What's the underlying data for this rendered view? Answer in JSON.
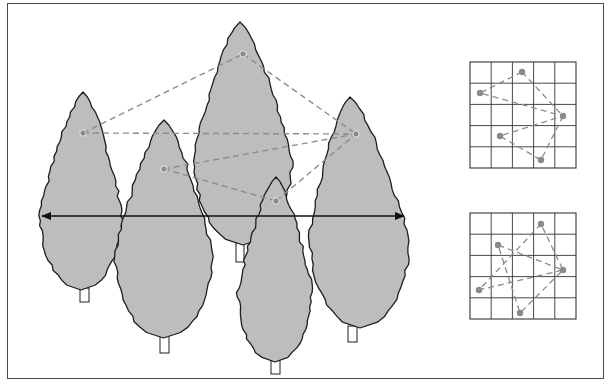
{
  "figure": {
    "description": "Five cypress-like trees with sampled points connected by dashed lines, a double-headed horizontal measurement arrow, and two 5x5 grid insets showing point configurations",
    "colors": {
      "background": "#ffffff",
      "frame": "#4a4a4a",
      "tree_fill": "#bdbdbd",
      "tree_outline": "#1e1e1e",
      "dashed_line": "#8c8c8c",
      "point": "#8a8a8a",
      "arrow": "#111111",
      "grid_line": "#333333"
    }
  },
  "trees": [
    {
      "id": "tree-1",
      "label": "left tree",
      "apex": [
        83,
        92
      ],
      "left": 40,
      "right": 122,
      "bottom": 290,
      "trunk": [
        80,
        290,
        9,
        12
      ]
    },
    {
      "id": "tree-2",
      "label": "second tree",
      "apex": [
        164,
        120
      ],
      "left": 115,
      "right": 212,
      "bottom": 338,
      "trunk": [
        160,
        338,
        9,
        15
      ]
    },
    {
      "id": "tree-3",
      "label": "tall center tree",
      "apex": [
        240,
        22
      ],
      "left": 194,
      "right": 292,
      "bottom": 245,
      "trunk": [
        236,
        245,
        8,
        17
      ]
    },
    {
      "id": "tree-4",
      "label": "front center tree",
      "apex": [
        276,
        177
      ],
      "left": 238,
      "right": 312,
      "bottom": 362,
      "trunk": [
        271,
        362,
        9,
        12
      ]
    },
    {
      "id": "tree-5",
      "label": "right tree",
      "apex": [
        350,
        97
      ],
      "left": 310,
      "right": 410,
      "bottom": 328,
      "trunk": [
        348,
        328,
        9,
        14
      ]
    }
  ],
  "points": [
    {
      "id": "p1",
      "x": 83,
      "y": 133
    },
    {
      "id": "p2",
      "x": 243,
      "y": 54
    },
    {
      "id": "p3",
      "x": 356,
      "y": 134
    },
    {
      "id": "p4",
      "x": 164,
      "y": 169
    },
    {
      "id": "p5",
      "x": 276,
      "y": 201
    }
  ],
  "connections": [
    [
      "p1",
      "p2"
    ],
    [
      "p2",
      "p3"
    ],
    [
      "p1",
      "p3"
    ],
    [
      "p4",
      "p3"
    ],
    [
      "p4",
      "p5"
    ],
    [
      "p5",
      "p3"
    ]
  ],
  "arrow": {
    "y": 216,
    "x1": 42,
    "x2": 404,
    "type": "double-headed"
  },
  "insets": [
    {
      "id": "grid-top",
      "x": 470,
      "y": 62,
      "size": 106,
      "cells": 5,
      "points": [
        [
          522,
          72
        ],
        [
          480,
          93
        ],
        [
          563,
          116
        ],
        [
          500,
          136
        ],
        [
          541,
          160
        ]
      ],
      "path": [
        [
          522,
          72
        ],
        [
          480,
          93
        ],
        [
          563,
          116
        ],
        [
          500,
          136
        ],
        [
          541,
          160
        ],
        [
          563,
          116
        ],
        [
          522,
          72
        ]
      ]
    },
    {
      "id": "grid-bottom",
      "x": 470,
      "y": 213,
      "size": 106,
      "cells": 5,
      "points": [
        [
          541,
          224
        ],
        [
          498,
          245
        ],
        [
          563,
          270
        ],
        [
          479,
          290
        ],
        [
          520,
          313
        ]
      ],
      "path": [
        [
          541,
          224
        ],
        [
          479,
          290
        ],
        [
          563,
          270
        ],
        [
          498,
          245
        ],
        [
          520,
          313
        ],
        [
          563,
          270
        ],
        [
          541,
          224
        ]
      ]
    }
  ]
}
